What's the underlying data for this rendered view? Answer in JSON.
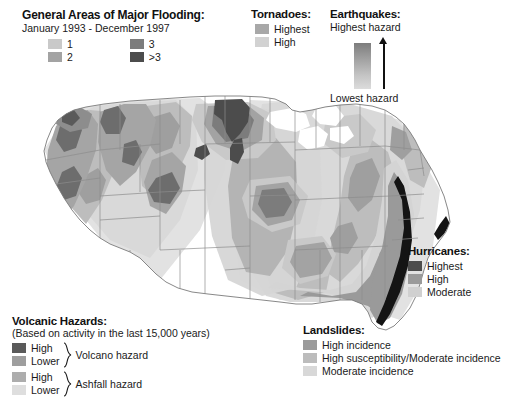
{
  "flooding": {
    "title": "General Areas of Major Flooding:",
    "subtitle": "January 1993 - December 1997",
    "items": [
      {
        "label": "1",
        "color": "#c9c9c9"
      },
      {
        "label": "2",
        "color": "#a3a3a3"
      },
      {
        "label": "3",
        "color": "#7c7c7c"
      },
      {
        "label": ">3",
        "color": "#4c4c4c"
      }
    ]
  },
  "tornadoes": {
    "title": "Tornadoes:",
    "items": [
      {
        "label": "Highest",
        "color": "#a8a8a8"
      },
      {
        "label": "High",
        "color": "#d2d2d2"
      }
    ]
  },
  "earthquakes": {
    "title": "Earthquakes:",
    "high_label": "Highest hazard",
    "low_label": "Lowest hazard",
    "gradient_top": "#7d7d7d",
    "gradient_bottom": "#dcdcdc"
  },
  "hurricanes": {
    "title": "Hurricanes:",
    "items": [
      {
        "label": "Highest",
        "color": "#4c4c4c"
      },
      {
        "label": "High",
        "color": "#9a9a9a"
      },
      {
        "label": "Moderate",
        "color": "#d0d0d0"
      }
    ]
  },
  "landslides": {
    "title": "Landslides:",
    "items": [
      {
        "label": "High incidence",
        "color": "#9b9b9b"
      },
      {
        "label": "High susceptibility/Moderate incidence",
        "color": "#bcbcbc"
      },
      {
        "label": "Moderate incidence",
        "color": "#d8d8d8"
      }
    ]
  },
  "volcanic": {
    "title": "Volcanic Hazards:",
    "subtitle": "(Based on activity in the last 15,000 years)",
    "groups": [
      {
        "name": "Volcano hazard",
        "items": [
          {
            "label": "High",
            "color": "#5a5a5a"
          },
          {
            "label": "Lower",
            "color": "#9e9e9e"
          }
        ]
      },
      {
        "name": "Ashfall hazard",
        "items": [
          {
            "label": "High",
            "color": "#adadad"
          },
          {
            "label": "Lower",
            "color": "#dedede"
          }
        ]
      }
    ]
  },
  "map": {
    "name": "united-states-natural-hazards-map",
    "background": "#ffffff",
    "state_border_color": "#8a8a8a",
    "coast_color": "#6a6a6a",
    "hurricane_coast_color": "#111111"
  }
}
